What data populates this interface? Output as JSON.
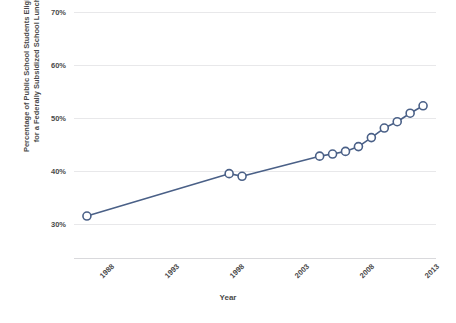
{
  "chart_data": {
    "type": "line",
    "title": "",
    "xlabel": "Year",
    "ylabel": "Percentage of Public School Students Eligible for a Federally Subsidized School Lunch",
    "ylabel_lines": [
      "Percentage of Public School Students Eligible",
      "for a Federally Subsidized School Lunch"
    ],
    "xlim": [
      1987,
      2015
    ],
    "ylim": [
      30,
      70
    ],
    "y_ticks": [
      30,
      40,
      50,
      60,
      70
    ],
    "y_tick_labels": [
      "30%",
      "40%",
      "50%",
      "60%",
      "70%"
    ],
    "x_ticks": [
      1988,
      1993,
      1998,
      2003,
      2008,
      2013
    ],
    "x_tick_labels": [
      "1988",
      "1993",
      "1998",
      "2003",
      "2008",
      "2013"
    ],
    "grid": "horizontal",
    "legend": "none",
    "series": [
      {
        "name": "Percent eligible for subsidized lunch",
        "color": "#4a6087",
        "marker": "open-circle",
        "x": [
          1988,
          1999,
          2000,
          2006,
          2007,
          2008,
          2009,
          2010,
          2011,
          2012,
          2013,
          2014
        ],
        "values": [
          31.5,
          39.5,
          39.0,
          42.8,
          43.2,
          43.7,
          44.6,
          46.3,
          48.1,
          49.3,
          50.9,
          52.3
        ],
        "points": [
          {
            "year": 1988,
            "value": 31.5
          },
          {
            "year": 1999,
            "value": 39.5
          },
          {
            "year": 2000,
            "value": 39.0
          },
          {
            "year": 2006,
            "value": 42.8
          },
          {
            "year": 2007,
            "value": 43.2
          },
          {
            "year": 2008,
            "value": 43.7
          },
          {
            "year": 2009,
            "value": 44.6
          },
          {
            "year": 2010,
            "value": 46.3
          },
          {
            "year": 2011,
            "value": 48.1
          },
          {
            "year": 2012,
            "value": 49.3
          },
          {
            "year": 2013,
            "value": 50.9
          },
          {
            "year": 2014,
            "value": 52.3
          }
        ]
      }
    ]
  },
  "axes": {
    "y_tick_labels": [
      "70%",
      "60%",
      "50%",
      "40%",
      "30%"
    ],
    "x_tick_labels": [
      "1988",
      "1993",
      "1998",
      "2003",
      "2008",
      "2013"
    ],
    "x_title": "Year",
    "y_title_line1": "Percentage of Public School Students Eligible",
    "y_title_line2": "for a Federally Subsidized School Lunch"
  },
  "colors": {
    "series": "#4a6087",
    "gridline": "#e8e8ea",
    "text": "#4a4a4a",
    "background": "#ffffff"
  }
}
